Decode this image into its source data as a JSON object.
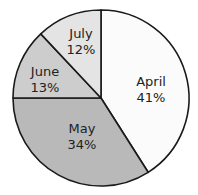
{
  "chart_data": {
    "type": "pie",
    "title": "",
    "start_angle_deg": 0,
    "direction": "clockwise",
    "slices": [
      {
        "label": "April",
        "value": 41,
        "value_label": "41%",
        "color": "#fbfbfb"
      },
      {
        "label": "May",
        "value": 34,
        "value_label": "34%",
        "color": "#b9b9b9"
      },
      {
        "label": "June",
        "value": 13,
        "value_label": "13%",
        "color": "#cdcdcd"
      },
      {
        "label": "July",
        "value": 12,
        "value_label": "12%",
        "color": "#e4e4e4"
      }
    ],
    "categories": [
      "April",
      "May",
      "June",
      "July"
    ],
    "values": [
      41,
      34,
      13,
      12
    ]
  },
  "labels": {
    "april": {
      "name": "April",
      "pct": "41%"
    },
    "may": {
      "name": "May",
      "pct": "34%"
    },
    "june": {
      "name": "June",
      "pct": "13%"
    },
    "july": {
      "name": "July",
      "pct": "12%"
    }
  }
}
